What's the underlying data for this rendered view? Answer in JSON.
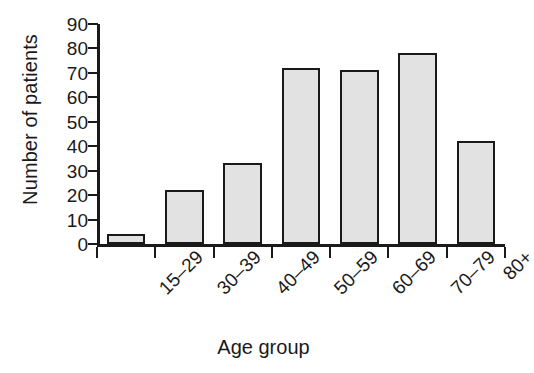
{
  "chart_data": {
    "type": "bar",
    "title": "",
    "subtitle": "",
    "xlabel": "Age group",
    "ylabel": "Number of patients",
    "categories": [
      "15–29",
      "30–39",
      "40–49",
      "50–59",
      "60–69",
      "70–79",
      "80+"
    ],
    "values": [
      4,
      22,
      33,
      72,
      71,
      78,
      42
    ],
    "ylim": [
      0,
      90
    ],
    "ytick_values": [
      0,
      10,
      20,
      30,
      40,
      50,
      60,
      70,
      80,
      90
    ],
    "ytick_labels": [
      "0",
      "10",
      "20",
      "30",
      "40",
      "50",
      "60",
      "70",
      "80",
      "90"
    ],
    "grid": false,
    "legend": null,
    "legend_position": "none",
    "xtick_label_rotation_deg": -45,
    "bar_fill_color": "#e2e2e2",
    "bar_edge_color": "#1a1a1a",
    "axis_color": "#1a1a1a",
    "background_color": "#ffffff"
  }
}
